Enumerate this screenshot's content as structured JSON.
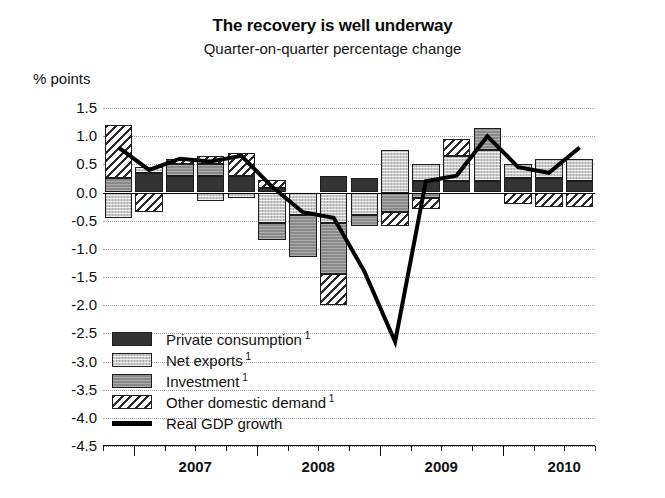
{
  "chart_data": {
    "type": "bar",
    "title": "The recovery is well underway",
    "subtitle": "Quarter-on-quarter percentage change",
    "ylabel": "% points",
    "xlabel": "",
    "ylim": [
      -4.5,
      1.5
    ],
    "ytick_step": 0.5,
    "grid": true,
    "stacked": true,
    "legend_position": "inside-bottom-left",
    "yticks": [
      "1.5",
      "1.0",
      "0.5",
      "0.0",
      "-0.5",
      "-1.0",
      "-1.5",
      "-2.0",
      "-2.5",
      "-3.0",
      "-3.5",
      "-4.0",
      "-4.5"
    ],
    "categories": [
      "2006Q4",
      "2007Q1",
      "2007Q2",
      "2007Q3",
      "2007Q4",
      "2008Q1",
      "2008Q2",
      "2008Q3",
      "2008Q4",
      "2009Q1",
      "2009Q2",
      "2009Q3",
      "2009Q4",
      "2010Q1",
      "2010Q2",
      "2010Q3"
    ],
    "xtick_labels": [
      "2007",
      "2008",
      "2009",
      "2010"
    ],
    "series": [
      {
        "name": "Private consumption",
        "key": "pc",
        "color": "#333333",
        "pattern": "solid-dark",
        "values": [
          0.0,
          0.35,
          0.3,
          0.3,
          0.3,
          0.08,
          0.0,
          0.3,
          0.25,
          0.0,
          0.2,
          0.2,
          0.2,
          0.25,
          0.25,
          0.2
        ]
      },
      {
        "name": "Net exports",
        "key": "ne",
        "color": "#c9c9c9",
        "pattern": "light-dotted",
        "values": [
          -0.45,
          0.1,
          0.0,
          -0.15,
          -0.1,
          -0.55,
          -0.4,
          -0.55,
          -0.4,
          0.75,
          0.3,
          0.45,
          0.55,
          0.25,
          0.35,
          0.4
        ]
      },
      {
        "name": "Investment",
        "key": "inv",
        "color": "#8a8a8a",
        "pattern": "mid-gray",
        "values": [
          0.25,
          0.0,
          0.2,
          0.2,
          0.0,
          -0.3,
          -0.75,
          -0.9,
          -0.2,
          -0.35,
          -0.1,
          0.0,
          0.4,
          0.0,
          0.0,
          0.0
        ]
      },
      {
        "name": "Other domestic demand",
        "key": "odd",
        "color": "#d2d2d2",
        "pattern": "diagonal-hatch",
        "values": [
          0.95,
          -0.35,
          0.1,
          0.15,
          0.4,
          0.15,
          0.0,
          -0.55,
          0.0,
          -0.25,
          -0.2,
          0.3,
          0.0,
          -0.2,
          -0.25,
          -0.25
        ]
      }
    ],
    "line_series": {
      "name": "Real GDP growth",
      "color": "#000000",
      "values": [
        0.8,
        0.4,
        0.6,
        0.55,
        0.65,
        0.1,
        -0.35,
        -0.45,
        -1.4,
        -2.65,
        0.2,
        0.3,
        1.0,
        0.45,
        0.35,
        0.8
      ]
    },
    "footnote_marker": "1"
  },
  "legend": {
    "items": [
      {
        "label": "Private consumption",
        "sup": "1",
        "key": "pc"
      },
      {
        "label": "Net exports",
        "sup": "1",
        "key": "ne"
      },
      {
        "label": "Investment",
        "sup": "1",
        "key": "inv"
      },
      {
        "label": "Other domestic demand",
        "sup": "1",
        "key": "odd"
      },
      {
        "label": "Real GDP growth",
        "sup": "",
        "key": "line"
      }
    ]
  }
}
